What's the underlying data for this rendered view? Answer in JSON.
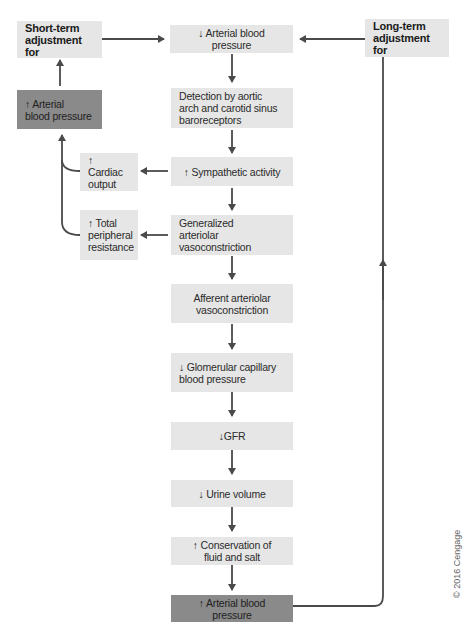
{
  "diagram": {
    "short_term": "Short-term\nadjustment for",
    "long_term": "Long-term\nadjustment for",
    "nodes": {
      "abp_down": "↓ Arterial blood pressure",
      "detection": "Detection by aortic\narch and carotid sinus\nbaroreceptors",
      "sympathetic": "↑ Sympathetic activity",
      "vasoconstriction": "Generalized\narteriolar vasoconstriction",
      "afferent": "Afferent arteriolar\nvasoconstriction",
      "glomerular": "↓ Glomerular capillary\nblood pressure",
      "gfr": "↓GFR",
      "urine": "↓ Urine volume",
      "conservation": "↑ Conservation of\nfluid and salt",
      "abp_up_long": "↑ Arterial blood pressure",
      "cardiac_output": "↑ Cardiac\noutput",
      "tpr": "↑ Total\nperipheral\nresistance",
      "abp_up_short": "↑ Arterial\nblood pressure"
    },
    "colors": {
      "light_box": "#e6e6e6",
      "dark_box": "#8a8a8a",
      "arrow": "#4a4a4a"
    }
  },
  "copyright": "© 2016 Cengage"
}
